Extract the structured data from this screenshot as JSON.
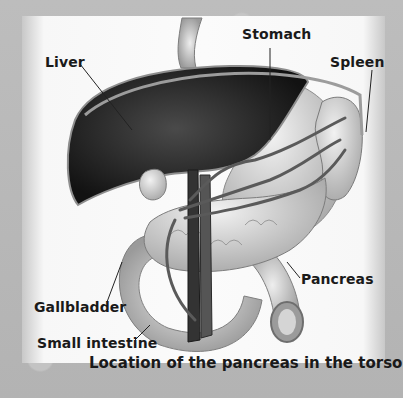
{
  "diagram": {
    "type": "anatomical illustration",
    "subject": "Location of the pancreas in the torso",
    "palette": "grayscale",
    "labels": [
      {
        "id": "liver",
        "text": "Liver"
      },
      {
        "id": "stomach",
        "text": "Stomach"
      },
      {
        "id": "spleen",
        "text": "Spleen"
      },
      {
        "id": "pancreas",
        "text": "Pancreas"
      },
      {
        "id": "gallbladder",
        "text": "Gallbladder"
      },
      {
        "id": "small-intestine",
        "text": "Small intestine"
      }
    ],
    "caption": "Location of the pancreas in the torso"
  },
  "colors": {
    "background": "#b9b9b9",
    "torso": "#f8f8f8",
    "liver": "#1c1c1c",
    "organ_light": "#d6d6d6",
    "vessel": "#5a5a5a",
    "text": "#1a1a1a"
  }
}
